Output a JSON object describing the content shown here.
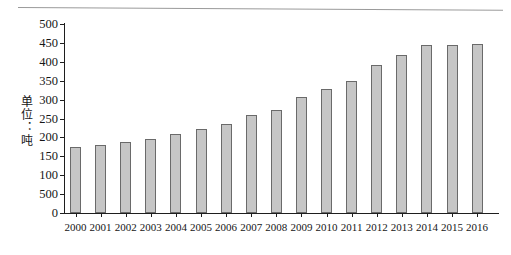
{
  "figure": {
    "y_axis_title": "单位：吨",
    "page_rule": "horizontal-rule"
  },
  "chart_data": {
    "type": "bar",
    "title": "",
    "xlabel": "",
    "ylabel": "单位：吨",
    "ylim": [
      0,
      500
    ],
    "grid": false,
    "legend": null,
    "y_ticks": [
      0,
      "500",
      100,
      150,
      200,
      250,
      300,
      350,
      400,
      450,
      500
    ],
    "y_tick_labels": [
      "0",
      "500",
      "100",
      "150",
      "200",
      "250",
      "300",
      "350",
      "400",
      "450",
      "500"
    ],
    "y_tick_values": [
      0,
      50,
      100,
      150,
      200,
      250,
      300,
      350,
      400,
      450,
      500
    ],
    "categories": [
      "2000",
      "2001",
      "2002",
      "2003",
      "2004",
      "2005",
      "2006",
      "2007",
      "2008",
      "2009",
      "2010",
      "2011",
      "2012",
      "2013",
      "2014",
      "2015",
      "2016"
    ],
    "values": [
      175,
      180,
      188,
      196,
      209,
      221,
      235,
      258,
      272,
      308,
      329,
      350,
      392,
      418,
      444,
      444,
      446
    ]
  }
}
